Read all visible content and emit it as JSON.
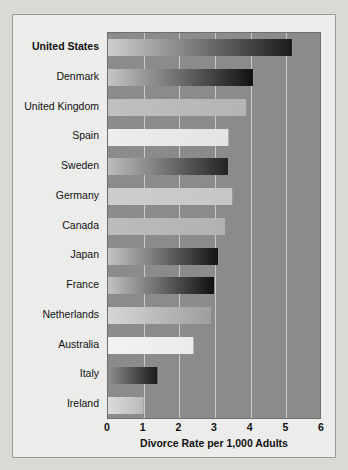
{
  "chart_data": {
    "type": "bar",
    "orientation": "horizontal",
    "title": "",
    "xlabel": "Divorce Rate per 1,000 Adults",
    "ylabel": "",
    "xlim": [
      0,
      6
    ],
    "xticks": [
      "0",
      "1",
      "2",
      "3",
      "4",
      "5",
      "6"
    ],
    "grid": true,
    "legend": "none",
    "categories": [
      "United States",
      "Denmark",
      "United Kingdom",
      "Spain",
      "Sweden",
      "Germany",
      "Canada",
      "Japan",
      "France",
      "Netherlands",
      "Australia",
      "Italy",
      "Ireland"
    ],
    "values": [
      5.2,
      4.1,
      3.9,
      3.4,
      3.4,
      3.5,
      3.3,
      3.1,
      3.0,
      2.9,
      2.4,
      1.4,
      1.0
    ],
    "highlighted_category": "United States",
    "bar_gradients": [
      [
        "#cfcfcf",
        "#1b1b1b"
      ],
      [
        "#c5c5c5",
        "#111111"
      ],
      [
        "#c0c0c0",
        "#b4b4b4"
      ],
      [
        "#ededed",
        "#e4e4e4"
      ],
      [
        "#bdbdbd",
        "#232323"
      ],
      [
        "#cdcdcd",
        "#c6c6c6"
      ],
      [
        "#bcbcbc",
        "#b2b2b2"
      ],
      [
        "#c4c4c4",
        "#141414"
      ],
      [
        "#c2c2c2",
        "#0f0f0f"
      ],
      [
        "#d6d6d6",
        "#9e9e9e"
      ],
      [
        "#f2f2f2",
        "#ebebeb"
      ],
      [
        "#8f8f8f",
        "#1a1a1a"
      ],
      [
        "#dcdcdc",
        "#b9b9b9"
      ]
    ],
    "plot_background": "#8b8b8b",
    "figure_background": "#ececea",
    "gridline_color": "#c9c9c7"
  }
}
